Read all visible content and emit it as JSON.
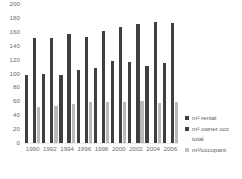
{
  "chart_data": {
    "type": "bar",
    "title": "",
    "xlabel": "",
    "ylabel": "",
    "ylim": [
      0,
      200
    ],
    "yticks": [
      0,
      20,
      40,
      60,
      80,
      100,
      120,
      140,
      160,
      180,
      200
    ],
    "grid": false,
    "legend_position": "right",
    "categories": [
      "1990",
      "1992",
      "1994",
      "1996",
      "1998",
      "2000",
      "2002",
      "2004",
      "2006"
    ],
    "series": [
      {
        "name": "m² rental",
        "color": "#3f3f3f",
        "values": [
          99,
          101,
          100,
          107,
          110,
          119,
          118,
          112,
          116
        ]
      },
      {
        "name": "m² owner occ",
        "color": "#fcfcfc",
        "values": [
          2,
          2,
          2,
          2,
          2,
          2,
          2,
          2,
          2
        ]
      },
      {
        "name": "total",
        "color": "#3f3f3f",
        "values": [
          153,
          152,
          158,
          154,
          163,
          168,
          172,
          176,
          174
        ]
      },
      {
        "name": "m²/occupant",
        "color": "#b9b9b9",
        "values": [
          53,
          55,
          57,
          60,
          61,
          61,
          62,
          59,
          60
        ]
      }
    ]
  },
  "legend": {
    "items": [
      {
        "label": "m² rental"
      },
      {
        "label": "m² owner occ"
      },
      {
        "label": "total"
      },
      {
        "label": "m²/occupant"
      }
    ]
  },
  "caption": {
    "text": ""
  }
}
